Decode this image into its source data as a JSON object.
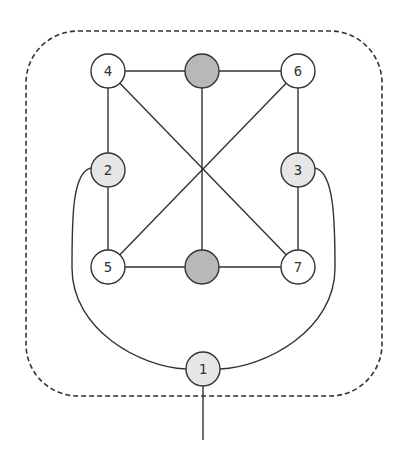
{
  "diagram": {
    "type": "graph",
    "frame": {
      "style": "dashed-rounded-rect",
      "x": 26,
      "y": 31,
      "width": 356,
      "height": 365,
      "radius": 52
    },
    "colors": {
      "stroke": "#333333",
      "white_fill": "#ffffff",
      "light_fill": "#e6e6e6",
      "dark_fill": "#b8b8b8"
    },
    "nodes": [
      {
        "id": "4",
        "label": "4",
        "x": 108,
        "y": 71,
        "fill": "white"
      },
      {
        "id": "top",
        "label": "",
        "x": 202,
        "y": 71,
        "fill": "dark"
      },
      {
        "id": "6",
        "label": "6",
        "x": 298,
        "y": 71,
        "fill": "white"
      },
      {
        "id": "2",
        "label": "2",
        "x": 108,
        "y": 170,
        "fill": "light"
      },
      {
        "id": "3",
        "label": "3",
        "x": 298,
        "y": 170,
        "fill": "light"
      },
      {
        "id": "5",
        "label": "5",
        "x": 108,
        "y": 267,
        "fill": "white"
      },
      {
        "id": "bottom",
        "label": "",
        "x": 202,
        "y": 267,
        "fill": "dark"
      },
      {
        "id": "7",
        "label": "7",
        "x": 298,
        "y": 267,
        "fill": "white"
      },
      {
        "id": "1",
        "label": "1",
        "x": 203,
        "y": 369,
        "fill": "light"
      }
    ],
    "edges": [
      [
        "4",
        "top"
      ],
      [
        "top",
        "6"
      ],
      [
        "4",
        "2"
      ],
      [
        "2",
        "5"
      ],
      [
        "6",
        "3"
      ],
      [
        "3",
        "7"
      ],
      [
        "5",
        "bottom"
      ],
      [
        "bottom",
        "7"
      ],
      [
        "4",
        "7"
      ],
      [
        "6",
        "5"
      ],
      [
        "top",
        "bottom"
      ],
      [
        "2",
        "1",
        "curved"
      ],
      [
        "3",
        "1",
        "curved"
      ],
      [
        "1",
        "external"
      ]
    ]
  }
}
